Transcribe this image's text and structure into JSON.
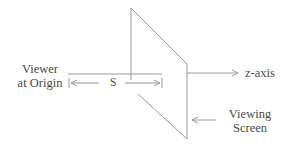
{
  "diagram": {
    "viewer_label": [
      "Viewer",
      "at Origin"
    ],
    "distance_label": "S",
    "axis_label": "z-axis",
    "screen_label": [
      "Viewing",
      "Screen"
    ],
    "line_color": "#9a9a9a",
    "text_color": "#4a4a4a"
  }
}
